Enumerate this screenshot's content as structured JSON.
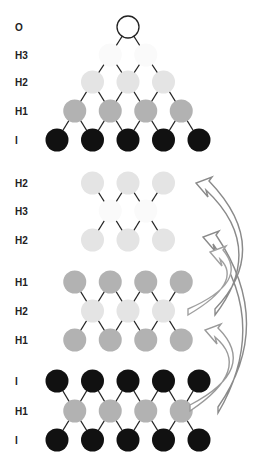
{
  "diagram": {
    "title": "",
    "colors": {
      "output": "#ffffff",
      "H3": "#fafafa",
      "H2": "#e4e4e4",
      "H1": "#b2b2b2",
      "I": "#111111",
      "edge": "#222222",
      "arrow": "#8a8a8a"
    },
    "sections": [
      {
        "id": "full-network",
        "rows": [
          {
            "label": "O",
            "layer": "output",
            "count": 1
          },
          {
            "label": "H3",
            "layer": "H3",
            "count": 2
          },
          {
            "label": "H2",
            "layer": "H2",
            "count": 3
          },
          {
            "label": "H1",
            "layer": "H1",
            "count": 4
          },
          {
            "label": "I",
            "layer": "I",
            "count": 5
          }
        ]
      },
      {
        "id": "autoencoder-h2",
        "rows": [
          {
            "label": "H2",
            "layer": "H2",
            "count": 3
          },
          {
            "label": "H3",
            "layer": "H3",
            "count": 2
          },
          {
            "label": "H2",
            "layer": "H2",
            "count": 3
          }
        ]
      },
      {
        "id": "autoencoder-h1",
        "rows": [
          {
            "label": "H1",
            "layer": "H1",
            "count": 4
          },
          {
            "label": "H2",
            "layer": "H2",
            "count": 3
          },
          {
            "label": "H1",
            "layer": "H1",
            "count": 4
          }
        ]
      },
      {
        "id": "autoencoder-input",
        "rows": [
          {
            "label": "I",
            "layer": "I",
            "count": 5
          },
          {
            "label": "H1",
            "layer": "H1",
            "count": 4
          },
          {
            "label": "I",
            "layer": "I",
            "count": 5
          }
        ]
      }
    ],
    "arrows": [
      {
        "from": "autoencoder-h2.H3",
        "to": "full-network.H3"
      },
      {
        "from": "autoencoder-h1.H2",
        "to": "autoencoder-h2.H2"
      },
      {
        "from": "autoencoder-input.H1",
        "to": "autoencoder-h1.H1"
      }
    ]
  }
}
